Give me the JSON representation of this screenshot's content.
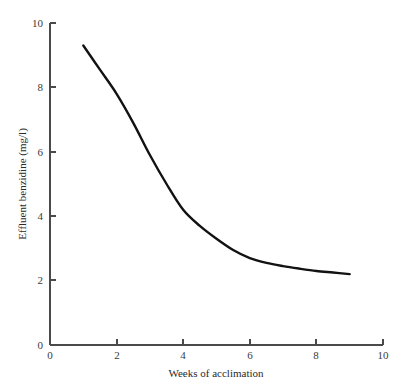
{
  "chart_data": {
    "type": "line",
    "title": "",
    "xlabel": "Weeks of acclimation",
    "ylabel": "Effluent benzidine (mg/l)",
    "xlim": [
      0,
      10
    ],
    "ylim": [
      0,
      10
    ],
    "xticks": [
      0,
      2,
      4,
      6,
      8,
      10
    ],
    "yticks": [
      0,
      2,
      4,
      6,
      8,
      10
    ],
    "xtick_labels": [
      "0",
      "2",
      "4",
      "6",
      "8",
      "10"
    ],
    "ytick_labels": [
      "0",
      "2",
      "4",
      "6",
      "8",
      "10"
    ],
    "grid": false,
    "legend": false,
    "line_color": "#121212",
    "axis_color": "#4a4a4a",
    "background_color": "#ffffff",
    "series": [
      {
        "name": "Effluent benzidine",
        "x": [
          1,
          1.5,
          2,
          2.5,
          3,
          3.5,
          4,
          4.5,
          5,
          5.5,
          6,
          6.5,
          7,
          7.5,
          8,
          8.5,
          9
        ],
        "values": [
          9.3,
          8.55,
          7.8,
          6.9,
          5.9,
          5.0,
          4.2,
          3.7,
          3.3,
          2.95,
          2.7,
          2.55,
          2.45,
          2.37,
          2.3,
          2.25,
          2.2
        ]
      }
    ]
  },
  "axes": {
    "x_title": "Weeks of acclimation",
    "y_title": "Effluent benzidine (mg/l)",
    "x_tick_labels": [
      "0",
      "2",
      "4",
      "6",
      "8",
      "10"
    ],
    "y_tick_labels": [
      "0",
      "2",
      "4",
      "6",
      "8",
      "10"
    ]
  }
}
